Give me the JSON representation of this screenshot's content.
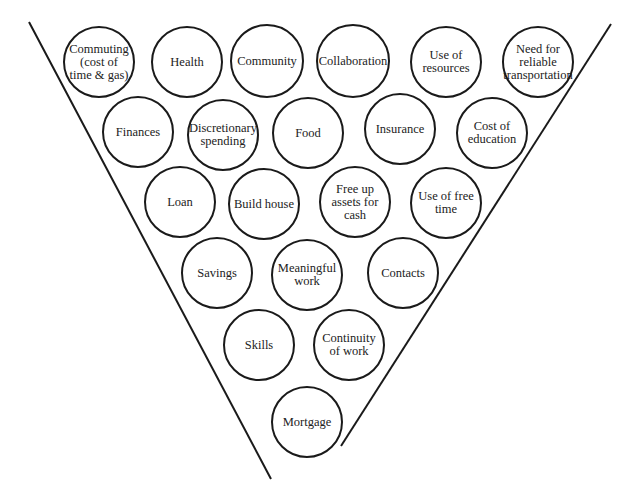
{
  "diagram": {
    "type": "inverted-triangle-funnel",
    "colors": {
      "stroke": "#1a1a1a",
      "text": "#222222",
      "background": "#ffffff"
    },
    "funnel": {
      "left_line": {
        "x1": 29,
        "y1": 22,
        "x2": 271,
        "y2": 479
      },
      "right_line": {
        "x1": 611,
        "y1": 24,
        "x2": 341,
        "y2": 446
      }
    },
    "rows": [
      {
        "row": 1,
        "nodes": [
          {
            "label": "Commuting\n(cost of\ntime & gas)",
            "cx": 99,
            "cy": 62,
            "r": 36
          },
          {
            "label": "Health",
            "cx": 187,
            "cy": 62,
            "r": 36
          },
          {
            "label": "Community",
            "cx": 267,
            "cy": 61,
            "r": 37
          },
          {
            "label": "Collaboration",
            "cx": 353,
            "cy": 61,
            "r": 37
          },
          {
            "label": "Use of\nresources",
            "cx": 446,
            "cy": 62,
            "r": 36
          },
          {
            "label": "Need for\nreliable\ntransportation",
            "cx": 538,
            "cy": 62,
            "r": 36
          }
        ]
      },
      {
        "row": 2,
        "nodes": [
          {
            "label": "Finances",
            "cx": 138,
            "cy": 132,
            "r": 36
          },
          {
            "label": "Discretionary\nspending",
            "cx": 223,
            "cy": 135,
            "r": 36
          },
          {
            "label": "Food",
            "cx": 308,
            "cy": 133,
            "r": 36
          },
          {
            "label": "Insurance",
            "cx": 400,
            "cy": 129,
            "r": 36
          },
          {
            "label": "Cost of\neducation",
            "cx": 492,
            "cy": 133,
            "r": 36
          }
        ]
      },
      {
        "row": 3,
        "nodes": [
          {
            "label": "Loan",
            "cx": 180,
            "cy": 202,
            "r": 36
          },
          {
            "label": "Build house",
            "cx": 264,
            "cy": 204,
            "r": 36
          },
          {
            "label": "Free up\nassets for\ncash",
            "cx": 355,
            "cy": 202,
            "r": 36
          },
          {
            "label": "Use of free\ntime",
            "cx": 446,
            "cy": 203,
            "r": 36
          }
        ]
      },
      {
        "row": 4,
        "nodes": [
          {
            "label": "Savings",
            "cx": 217,
            "cy": 273,
            "r": 36
          },
          {
            "label": "Meaningful\nwork",
            "cx": 307,
            "cy": 275,
            "r": 36
          },
          {
            "label": "Contacts",
            "cx": 403,
            "cy": 273,
            "r": 36
          }
        ]
      },
      {
        "row": 5,
        "nodes": [
          {
            "label": "Skills",
            "cx": 259,
            "cy": 345,
            "r": 36
          },
          {
            "label": "Continuity\nof work",
            "cx": 349,
            "cy": 345,
            "r": 36
          }
        ]
      },
      {
        "row": 6,
        "nodes": [
          {
            "label": "Mortgage",
            "cx": 307,
            "cy": 422,
            "r": 36
          }
        ]
      }
    ]
  }
}
